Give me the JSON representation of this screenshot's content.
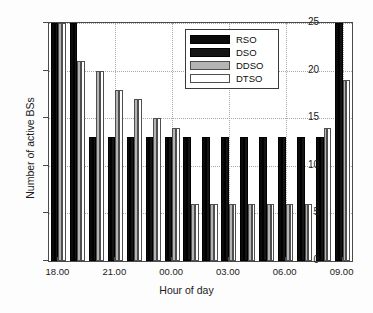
{
  "chart_data": {
    "type": "bar",
    "title": "",
    "xlabel": "Hour of day",
    "ylabel": "Number of active BSs",
    "ylim": [
      0,
      25
    ],
    "yticks": [
      0,
      5,
      10,
      15,
      20,
      25
    ],
    "grid": true,
    "legend_position": "top-center",
    "categories": [
      "18.00",
      "19.00",
      "20.00",
      "21.00",
      "22.00",
      "23.00",
      "00.00",
      "01.00",
      "02.00",
      "03.00",
      "04.00",
      "05.00",
      "06.00",
      "07.00",
      "08.00",
      "09.00"
    ],
    "xticks": [
      "18.00",
      "21.00",
      "00.00",
      "03.00",
      "06.00",
      "09.00"
    ],
    "xtick_indices": [
      0,
      3,
      6,
      9,
      12,
      15
    ],
    "series": [
      {
        "name": "RSO",
        "color": "#0a0a0a",
        "values": [
          25,
          25,
          13,
          13,
          13,
          13,
          13,
          13,
          13,
          13,
          13,
          13,
          13,
          13,
          13,
          25
        ]
      },
      {
        "name": "DSO",
        "color": "#141414",
        "values": [
          25,
          25,
          13,
          13,
          13,
          13,
          13,
          13,
          13,
          13,
          13,
          13,
          13,
          13,
          13,
          25
        ]
      },
      {
        "name": "DDSO",
        "color": "#b4b4b4",
        "values": [
          25,
          21,
          20,
          18,
          17,
          15,
          14,
          6,
          6,
          6,
          6,
          6,
          6,
          6,
          14,
          19
        ]
      },
      {
        "name": "DTSO",
        "color": "#ffffff",
        "values": [
          25,
          21,
          20,
          18,
          17,
          15,
          14,
          6,
          6,
          6,
          6,
          6,
          6,
          6,
          14,
          19
        ]
      }
    ]
  },
  "legend": {
    "entries": [
      "RSO",
      "DSO",
      "DDSO",
      "DTSO"
    ]
  }
}
